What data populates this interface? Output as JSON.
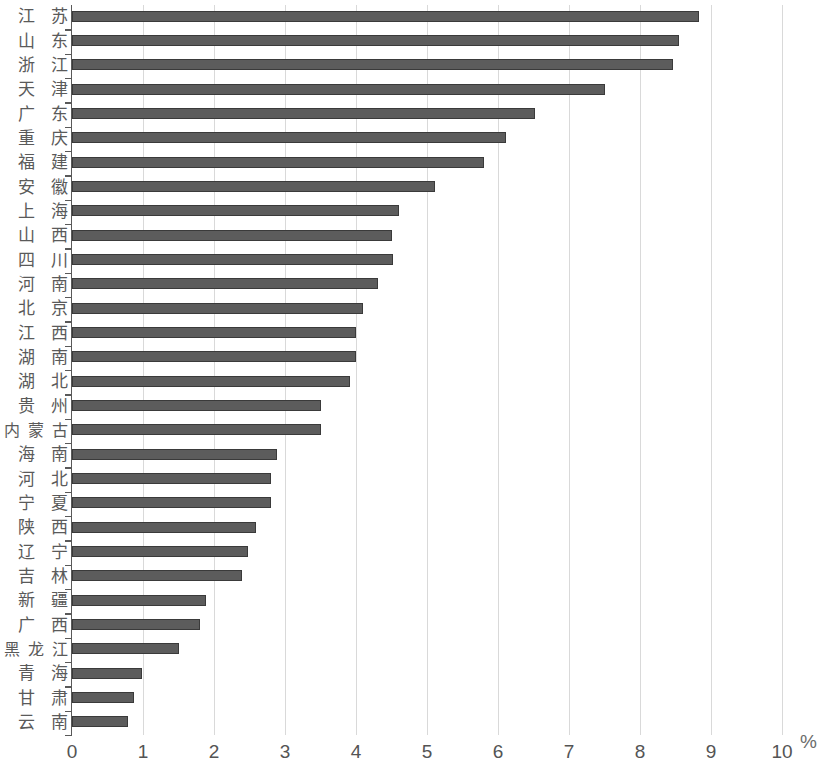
{
  "chart_data": {
    "type": "bar",
    "orientation": "horizontal",
    "title": "",
    "subtitle": "",
    "xlabel": "%",
    "ylabel": "",
    "xlim": [
      0,
      10
    ],
    "xticks": [
      "0",
      "1",
      "2",
      "3",
      "4",
      "5",
      "6",
      "7",
      "8",
      "9",
      "10"
    ],
    "grid": "vertical",
    "legend": null,
    "bar_color": "#5c5c5c",
    "bar_edge_color": "#3a3a3a",
    "gridline_color": "#d9d9d9",
    "axis_color": "#595959",
    "categories": [
      "江苏",
      "山东",
      "浙江",
      "天津",
      "广东",
      "重庆",
      "福建",
      "安徽",
      "上海",
      "山西",
      "四川",
      "河南",
      "北京",
      "江西",
      "湖南",
      "湖北",
      "贵州",
      "内蒙古",
      "海南",
      "河北",
      "宁夏",
      "陕西",
      "辽宁",
      "吉林",
      "新疆",
      "广西",
      "黑龙江",
      "青海",
      "甘肃",
      "云南"
    ],
    "values": [
      8.83,
      8.55,
      8.46,
      7.51,
      6.52,
      6.11,
      5.8,
      5.11,
      4.61,
      4.51,
      4.52,
      4.31,
      4.1,
      4.0,
      4.0,
      3.92,
      3.51,
      3.51,
      2.89,
      2.8,
      2.8,
      2.59,
      2.48,
      2.39,
      1.89,
      1.8,
      1.51,
      0.99,
      0.87,
      0.79
    ]
  }
}
